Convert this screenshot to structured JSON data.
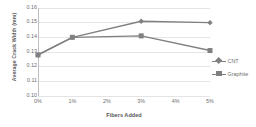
{
  "chart_data": {
    "type": "line",
    "title": "",
    "xlabel": "Fibers Added",
    "ylabel": "Average Crack Width (mm)",
    "categories": [
      "0%",
      "1%",
      "2%",
      "3%",
      "4%",
      "5%"
    ],
    "x": [
      0,
      1,
      2,
      3,
      4,
      5
    ],
    "xlim": [
      0,
      5
    ],
    "ylim": [
      0.1,
      0.16
    ],
    "yticks": [
      "0.16",
      "0.15",
      "0.14",
      "0.13",
      "0.12",
      "0.11",
      "0.10"
    ],
    "ytick_values": [
      0.16,
      0.15,
      0.14,
      0.13,
      0.12,
      0.11,
      0.1
    ],
    "grid": true,
    "legend_position": "right",
    "series": [
      {
        "name": "CNT",
        "marker": "diamond",
        "color": "#808080",
        "x": [
          0,
          1,
          3,
          5
        ],
        "values": [
          0.128,
          0.14,
          0.151,
          0.15
        ]
      },
      {
        "name": "Graphite",
        "marker": "square",
        "color": "#808080",
        "x": [
          0,
          1,
          3,
          5
        ],
        "values": [
          0.128,
          0.14,
          0.141,
          0.131
        ]
      }
    ]
  },
  "legend": {
    "items": [
      {
        "label": "CNT"
      },
      {
        "label": "Graphite"
      }
    ]
  },
  "colors": {
    "series": "#808080",
    "gridline": "#e4e4e4",
    "axis": "#bfbfbf",
    "text": "#6e6e6e",
    "title_text": "#595959",
    "background": "#ffffff"
  }
}
